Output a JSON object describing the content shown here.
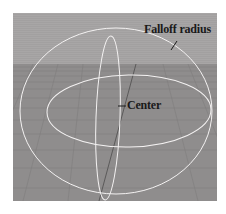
{
  "figure": {
    "viewport": {
      "sky_color": "#a6a4a4",
      "ground_color": "#8e8c8c",
      "grid_line_color": "#7c7a7a",
      "sphere_color": "#f4f2f2",
      "axis_line_color": "#4a4848"
    },
    "labels": {
      "falloff_radius": "Falloff radius",
      "center": "Center"
    }
  }
}
